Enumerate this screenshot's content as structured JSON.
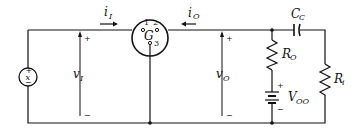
{
  "diagram": {
    "type": "circuit-schematic",
    "labels": {
      "input_current": "i",
      "input_current_sub": "I",
      "output_current": "i",
      "output_current_sub": "O",
      "gate_element": "G",
      "pin1": "1",
      "pin2": "2",
      "pin3": "3",
      "input_voltage": "v",
      "input_voltage_sub": "I",
      "output_voltage": "v",
      "output_voltage_sub": "O",
      "source_label": "x",
      "coupling_cap": "C",
      "coupling_cap_sub": "C",
      "output_resistor": "R",
      "output_resistor_sub": "O",
      "load_resistor": "R",
      "load_resistor_sub": "i",
      "supply": "V",
      "supply_sub": "OO",
      "plus": "+",
      "minus": "−"
    },
    "colors": {
      "stroke": "#111111",
      "background": "#ffffff"
    }
  }
}
